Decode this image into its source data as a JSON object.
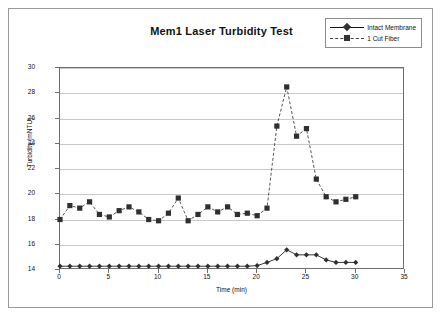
{
  "chart_data": {
    "type": "line",
    "title": "Mem1 Laser Turbidity Test",
    "xlabel": "Time (min)",
    "ylabel": "Turbidity (mNTU)",
    "xlim": [
      0,
      35
    ],
    "ylim": [
      14,
      30
    ],
    "xticks": [
      0,
      5,
      10,
      15,
      20,
      25,
      30,
      35
    ],
    "yticks": [
      14,
      16,
      18,
      20,
      22,
      24,
      26,
      28,
      30
    ],
    "grid": "horizontal",
    "legend_position": "top-right",
    "x": [
      0,
      1,
      2,
      3,
      4,
      5,
      6,
      7,
      8,
      9,
      10,
      11,
      12,
      13,
      14,
      15,
      16,
      17,
      18,
      19,
      20,
      21,
      22,
      23,
      24,
      25,
      26,
      27,
      28,
      29,
      30
    ],
    "series": [
      {
        "name": "Intact Membrane",
        "marker": "diamond",
        "linestyle": "solid",
        "color": "#222222",
        "values": [
          14.3,
          14.3,
          14.3,
          14.3,
          14.3,
          14.3,
          14.3,
          14.3,
          14.3,
          14.3,
          14.3,
          14.3,
          14.3,
          14.3,
          14.3,
          14.3,
          14.3,
          14.3,
          14.3,
          14.3,
          14.35,
          14.6,
          14.9,
          15.6,
          15.2,
          15.2,
          15.2,
          14.8,
          14.6,
          14.6,
          14.6
        ]
      },
      {
        "name": "1 Cut Fiber",
        "marker": "square",
        "linestyle": "dashed",
        "color": "#444444",
        "values": [
          18.0,
          19.1,
          18.9,
          19.4,
          18.4,
          18.2,
          18.7,
          19.0,
          18.6,
          18.0,
          17.9,
          18.5,
          19.7,
          17.9,
          18.4,
          19.0,
          18.6,
          19.0,
          18.4,
          18.5,
          18.3,
          18.9,
          25.4,
          28.5,
          24.6,
          25.2,
          21.2,
          19.8,
          19.4,
          19.6,
          19.8
        ]
      }
    ]
  },
  "legend": {
    "items": [
      {
        "label": "Intact Membrane"
      },
      {
        "label": "1 Cut Fiber"
      }
    ]
  }
}
